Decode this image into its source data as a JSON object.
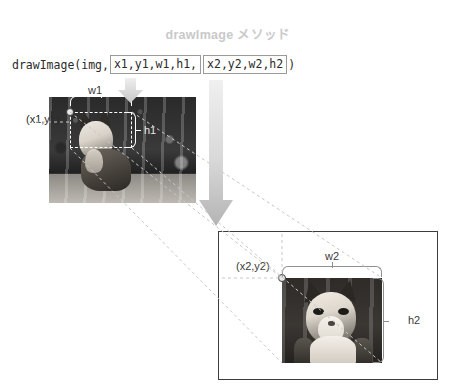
{
  "title": "drawImage メソッド",
  "code": {
    "prefix": "drawImage(img,",
    "box1": "x1,y1,w1,h1,",
    "box2": "x2,y2,w2,h2",
    "suffix": ")"
  },
  "source": {
    "origin_label": "(x1,y1)",
    "width_label": "w1",
    "height_label": "h1"
  },
  "destination": {
    "origin_label": "(x2,y2)",
    "width_label": "w2",
    "height_label": "h2"
  },
  "icons": {
    "arrow_large": "down-arrow-icon",
    "arrow_small": "down-arrow-icon"
  },
  "colors": {
    "title": "#c9c9c9",
    "code_text": "#2b2b2b",
    "code_box_border": "#9a9a9a",
    "panel_border": "#3d3d3d",
    "brace": "#8f8f8f",
    "connector": "#c0c0c0",
    "arrow_start": "#e8e8e8",
    "arrow_end": "#b9b9b9",
    "marker_fill": "#e9e9e9",
    "marker_stroke": "#3a3a3a"
  }
}
